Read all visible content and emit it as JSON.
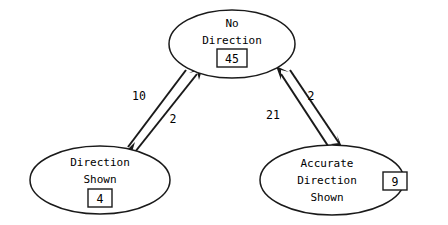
{
  "diagram": {
    "type": "state-transition-diagram",
    "background_color": "#ffffff",
    "stroke_color": "#1a1a1a",
    "nodes": [
      {
        "id": "no-direction",
        "lines": [
          "No",
          "Direction"
        ],
        "line1": "No",
        "line2": "Direction",
        "count": "45",
        "count_position": "below"
      },
      {
        "id": "direction-shown",
        "lines": [
          "Direction",
          "Shown"
        ],
        "line1": "Direction",
        "line2": "Shown",
        "count": "4",
        "count_position": "below"
      },
      {
        "id": "accurate-direction-shown",
        "lines": [
          "Accurate",
          "Direction",
          "Shown"
        ],
        "line1": "Accurate",
        "line2": "Direction",
        "line3": "Shown",
        "count": "9",
        "count_position": "inline-right"
      }
    ],
    "edges": [
      {
        "id": "no-direction-to-direction-shown",
        "label": "10",
        "from": "no-direction",
        "to": "direction-shown"
      },
      {
        "id": "direction-shown-to-no-direction",
        "label": "2",
        "from": "direction-shown",
        "to": "no-direction"
      },
      {
        "id": "accurate-to-no-direction",
        "label": "21",
        "from": "accurate-direction-shown",
        "to": "no-direction"
      },
      {
        "id": "no-direction-to-accurate",
        "label": "2",
        "from": "no-direction",
        "to": "accurate-direction-shown"
      }
    ]
  }
}
